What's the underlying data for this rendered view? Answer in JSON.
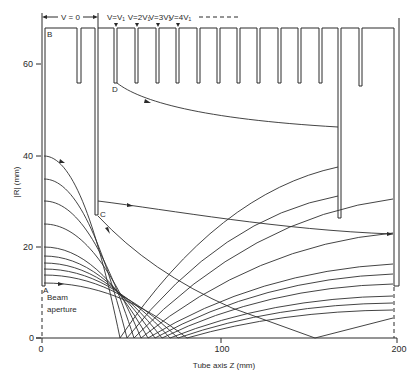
{
  "diagram": {
    "top_labels": {
      "v0": "V = 0",
      "v1": "V=V₁",
      "v2": "V=2V₁",
      "v3": "V=3V₁",
      "v4": "V=4V₁"
    },
    "points": {
      "A": "A",
      "B": "B",
      "C": "C",
      "D": "D"
    },
    "y_axis": {
      "label": "|R| (mm)",
      "ticks": [
        "0",
        "20",
        "40",
        "60"
      ]
    },
    "x_axis": {
      "label": "Tube axis  Z (mm)",
      "ticks": [
        "0",
        "100",
        "200"
      ]
    },
    "annotations": {
      "beam_aperture_line1": "Beam",
      "beam_aperture_line2": "aperture"
    },
    "electrode_outline": "M45,286 L45,28 L77,28 L77,83 L81,83 L81,28 L95,28 L95,215 L98,215 L98,28 L114,28 L114,83 L117,83 L117,28 L135,28 L135,83 L138,83 L138,28 L156,28 L156,83 L159,83 L159,28 L176,28 L176,83 L179,83 L179,28 L197,28 L197,83 L200,83 L200,28 L217,28 L217,83 L220,83 L220,28 L237,28 L237,83 L240,83 L240,28 L257,28 L257,83 L260,83 L260,28 L278,28 L278,83 L281,83 L281,28 L298,28 L298,83 L301,83 L301,28 L319,28 L319,83 L322,83 L322,28 L338,28 L338,218 L341,218 L341,28 L359,28 L359,86 L362,86 L362,28 L394,28 L394,286",
    "rays": [
      {
        "start_R_mm": 40,
        "axis_cross_Z_mm": 45,
        "d": "M44,156 C70.6,156 94.9,216.1 120,338 Q218.1,192.7 338,167"
      },
      {
        "start_R_mm": 35,
        "axis_cross_Z_mm": 49,
        "d": "M44,179 C73.1,179 99.6,231.5 127,338 Q222,217.3 338,196"
      },
      {
        "start_R_mm": 30,
        "axis_cross_Z_mm": 53,
        "d": "M44,201 C75.5,201 104.3,246.2 134,338 Q250.6,217.1 393,199"
      },
      {
        "start_R_mm": 25,
        "axis_cross_Z_mm": 57,
        "d": "M44,224 C78,224 109,261.6 141,338 Q254.4,245.6 393,233"
      },
      {
        "start_R_mm": 20,
        "axis_cross_Z_mm": 60,
        "d": "M44,247 C80.4,247 113.7,277 148,338 Q258,271.4 393,264"
      },
      {
        "start_R_mm": 18,
        "axis_cross_Z_mm": 64,
        "d": "M44,256 C82.9,256 118.4,283.1 155,338 Q262,279.1 393,274"
      },
      {
        "start_R_mm": 16.5,
        "axis_cross_Z_mm": 68,
        "d": "M44,263 C85.3,263 123.1,287.8 162,338 Q266,287.2 393,284"
      },
      {
        "start_R_mm": 15,
        "axis_cross_Z_mm": 73,
        "d": "M44,269 C88.1,269 128.4,291.8 170,338 Q270,298.1 393,296"
      },
      {
        "start_R_mm": 14,
        "axis_cross_Z_mm": 77,
        "d": "M44,275 C90.9,275 133.8,295.8 178,338 Q275,304.4 393,303"
      },
      {
        "start_R_mm": 12,
        "axis_cross_Z_mm": 82,
        "d": "M44,283 C94,283 139.8,301.2 187,338 Q280,311 393,310"
      }
    ],
    "special_rays": {
      "from_C_upper": {
        "d": "M98,201 C170,210 280,230 393,234"
      },
      "from_C_lower": {
        "d": "M98,216 Q150,272 232,308 L315,338 L393,318"
      },
      "from_D": {
        "d": "M117,83 C140,101 200,119 338,127"
      }
    },
    "colors": {
      "line": "#2a2a2a",
      "background": "#ffffff"
    }
  }
}
